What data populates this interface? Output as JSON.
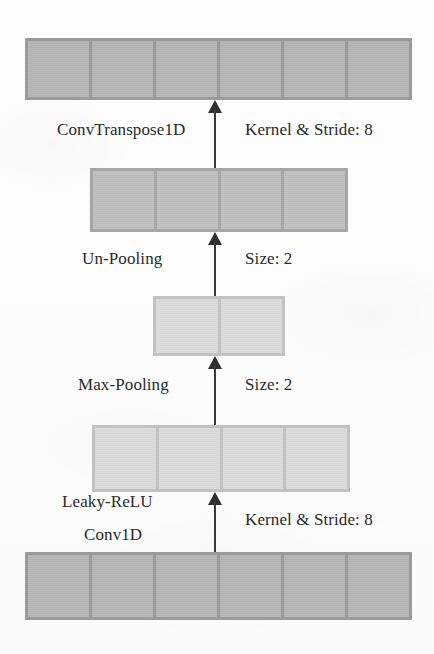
{
  "diagram": {
    "type": "neural-network-architecture",
    "flow_direction": "bottom-to-top",
    "palette": {
      "dark_block": "#b2b2b2",
      "dark_border": "#9a9a9a",
      "mid_block": "#bdbdbd",
      "mid_border": "#a6a6a6",
      "light_block": "#d8d8d8",
      "light_border": "#c2c2c2",
      "arrow": "#2f2f2f",
      "text": "#2a2a2a",
      "page": "#fdfdfd"
    },
    "layers": [
      {
        "id": "output-tensor",
        "name": "output-tensor",
        "cells": 6,
        "shade": "dark",
        "position": "top"
      },
      {
        "id": "unpooled-tensor",
        "name": "unpooled-tensor",
        "cells": 4,
        "shade": "mid",
        "position": "second"
      },
      {
        "id": "pooled-tensor",
        "name": "pooled-tensor",
        "cells": 2,
        "shade": "light",
        "position": "middle"
      },
      {
        "id": "activated-tensor",
        "name": "activated-tensor",
        "cells": 4,
        "shade": "light",
        "position": "fourth"
      },
      {
        "id": "input-tensor",
        "name": "input-tensor",
        "cells": 6,
        "shade": "dark",
        "position": "bottom"
      }
    ],
    "operations": [
      {
        "id": "conv-transpose-1d",
        "op_label": "ConvTranspose1D",
        "param_label": "Kernel & Stride: 8",
        "secondary_label": ""
      },
      {
        "id": "un-pooling",
        "op_label": "Un-Pooling",
        "param_label": "Size: 2",
        "secondary_label": ""
      },
      {
        "id": "max-pooling",
        "op_label": "Max-Pooling",
        "param_label": "Size: 2",
        "secondary_label": ""
      },
      {
        "id": "conv-1d",
        "op_label": "Conv1D",
        "param_label": "Kernel & Stride: 8",
        "secondary_label": "Leaky-ReLU"
      }
    ]
  }
}
